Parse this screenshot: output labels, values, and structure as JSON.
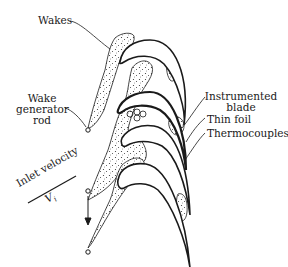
{
  "diagram": {
    "type": "turbine-cascade-wake-schematic",
    "labels": {
      "wakes": "Wakes",
      "wake_generator_rod_line1": "Wake",
      "wake_generator_rod_line2": "generator",
      "wake_generator_rod_line3": "rod",
      "instrumented_blade_line1": "Instrumented",
      "instrumented_blade_line2": "blade",
      "thin_foil": "Thin foil",
      "thermocouples": "Thermocouples",
      "inlet_velocity": "Inlet velocity",
      "velocity_symbol": "V",
      "velocity_subscript": "i"
    },
    "elements": {
      "blade_count": 4,
      "wake_count": 3,
      "rod_count": 3,
      "rod_motion": "downward arrow"
    },
    "colors": {
      "line": "#1a1a1a",
      "background": "#ffffff"
    }
  }
}
